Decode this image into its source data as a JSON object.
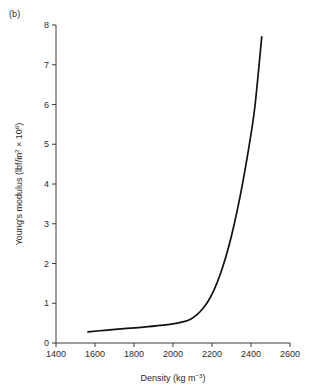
{
  "figure": {
    "panel_label": "(b)",
    "background_color": "#ffffff",
    "line_color": "#111111",
    "axis_color": "#3a3a3a"
  },
  "chart_data": {
    "type": "line",
    "title": "",
    "subtitle": "",
    "panel": "(b)",
    "xlabel": "Density (kg m−3)",
    "xlabel_parts": {
      "base": "Density (kg m",
      "sup": "−3",
      "tail": ")"
    },
    "ylabel": "Young's modulus (lbf/in² × 10⁶)",
    "ylabel_parts": {
      "pre": "Young's modulus (lbf/in",
      "sup1": "2",
      "mid": " × 10",
      "sup2": "6",
      "tail": ")"
    },
    "xlim": [
      1400,
      2600
    ],
    "ylim": [
      0,
      8
    ],
    "xticks": [
      1400,
      1600,
      1800,
      2000,
      2200,
      2400,
      2600
    ],
    "xtick_labels": [
      "1400",
      "1600",
      "1800",
      "2000",
      "2200",
      "2400",
      "2600"
    ],
    "yticks": [
      0,
      1,
      2,
      3,
      4,
      5,
      6,
      7,
      8
    ],
    "ytick_labels": [
      "0",
      "1",
      "2",
      "3",
      "4",
      "5",
      "6",
      "7",
      "8"
    ],
    "grid": false,
    "legend": false,
    "legend_position": "none",
    "series": [
      {
        "name": "Young's modulus vs density",
        "x": [
          1564,
          1650,
          1750,
          1850,
          1950,
          2000,
          2050,
          2090,
          2120,
          2150,
          2180,
          2210,
          2240,
          2270,
          2300,
          2330,
          2360,
          2390,
          2420,
          2455
        ],
        "y": [
          0.28,
          0.32,
          0.36,
          0.4,
          0.45,
          0.48,
          0.53,
          0.6,
          0.7,
          0.85,
          1.05,
          1.33,
          1.7,
          2.15,
          2.7,
          3.35,
          4.1,
          4.95,
          5.95,
          7.7
        ]
      }
    ]
  }
}
